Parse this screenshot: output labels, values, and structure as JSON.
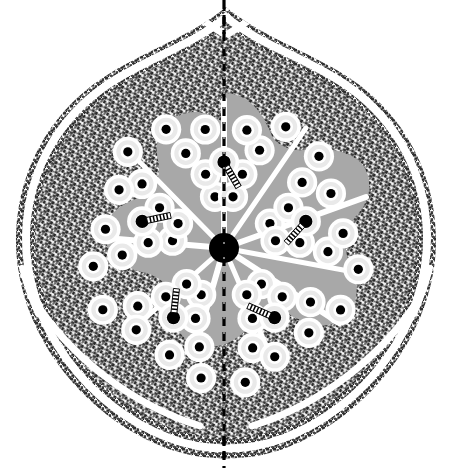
{
  "figure": {
    "domain_kind": "scientific-diagram",
    "canvas": {
      "width": 451,
      "height": 468,
      "background": "#ffffff"
    },
    "colors": {
      "background": "#ffffff",
      "stipple_dark": "#3b3b3b",
      "stipple_dark_alt": "#2e2e2e",
      "cortex_gray": "#a8a8a8",
      "cell_halo_light": "#e9e9e9",
      "cell_wall_white": "#ffffff",
      "nucleus_black": "#000000",
      "dashed_line": "#000000"
    },
    "outline": {
      "name": "organ-outline",
      "description": "teardrop / heart shaped outline, pointed at top, rounded at bottom",
      "center_x": 226,
      "apex_y": 8,
      "base_y": 458,
      "max_half_width": 213
    },
    "symmetry": {
      "type": "pentaradial",
      "arms": 5,
      "mirror_axis": "vertical",
      "arm_angles_deg": [
        270,
        342,
        54,
        126,
        198
      ]
    },
    "center_node": {
      "name": "central-pith-dot",
      "cx": 224,
      "cy": 248,
      "r": 15
    },
    "midline": {
      "name": "midline-dashed-axis",
      "x": 224,
      "y_top": 2,
      "y_bottom": 466,
      "dash": "9 6",
      "width": 3
    },
    "layers": [
      {
        "id": "outer-stipple-rind",
        "label": "outer stippled rind (epidermis / sclerenchyma)"
      },
      {
        "id": "white-separation-gap",
        "label": "white separation gap"
      },
      {
        "id": "inner-stipple-cortex",
        "label": "inner stippled cortex"
      },
      {
        "id": "gray-ground-tissue",
        "label": "gray ground tissue (parenchyma)"
      },
      {
        "id": "cellular-stele",
        "label": "star-shaped cellular stele"
      }
    ],
    "radial_white_rays": {
      "name": "radial-white-rays",
      "count": 3,
      "description": "white rays from apex region and lower left / lower right splitting the rind",
      "rays_deg": [
        232,
        308,
        90
      ]
    },
    "cells": {
      "name": "vascular-cells",
      "count_per_arm": 11,
      "nucleus_r": 4.6,
      "big_nucleus_r": 6.6,
      "halo_r": 11.5,
      "wall_r": 13.5,
      "ladder": {
        "name": "scalariform-thickening",
        "rungs": 7,
        "length": 24,
        "width": 6
      }
    },
    "chart_data": {
      "type": "scatter",
      "title": "Plant stem cross-section (pentaradial vascular stele)",
      "xlabel": "",
      "ylabel": "",
      "grid": false,
      "legend": "none"
    }
  }
}
